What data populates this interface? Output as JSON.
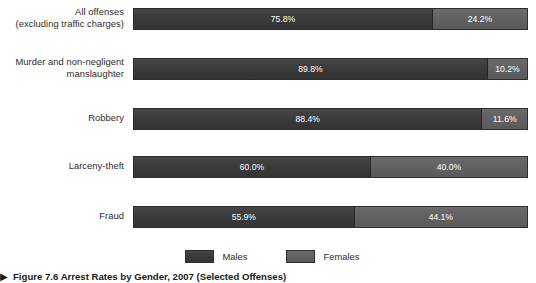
{
  "chart_data": {
    "type": "bar",
    "orientation": "horizontal",
    "stacked": true,
    "stack_total_percent": 100,
    "title": "Figure 7.6 Arrest Rates by Gender, 2007 (Selected Offenses)",
    "xlabel": "",
    "ylabel": "",
    "xlim": [
      0,
      100
    ],
    "grid": false,
    "legend_position": "bottom-center",
    "categories": [
      "All offenses (excluding traffic charges)",
      "Murder and non-negligent manslaughter",
      "Robbery",
      "Larceny-theft",
      "Fraud"
    ],
    "series": [
      {
        "name": "Males",
        "color": "#3d3d3d",
        "values": [
          75.8,
          89.8,
          88.4,
          60.0,
          55.9
        ]
      },
      {
        "name": "Females",
        "color": "#636363",
        "values": [
          24.2,
          10.2,
          11.6,
          40.0,
          44.1
        ]
      }
    ]
  },
  "rows": [
    {
      "label_line1": "All offenses",
      "label_line2": "(excluding traffic charges)",
      "male_value": 75.8,
      "female_value": 24.2,
      "male_label": "75.8%",
      "female_label": "24.2%"
    },
    {
      "label_line1": "Murder and non-negligent",
      "label_line2": "manslaughter",
      "male_value": 89.8,
      "female_value": 10.2,
      "male_label": "89.8%",
      "female_label": "10.2%"
    },
    {
      "label_line1": "Robbery",
      "label_line2": "",
      "male_value": 88.4,
      "female_value": 11.6,
      "male_label": "88.4%",
      "female_label": "11.6%"
    },
    {
      "label_line1": "Larceny-theft",
      "label_line2": "",
      "male_value": 60.0,
      "female_value": 40.0,
      "male_label": "60.0%",
      "female_label": "40.0%"
    },
    {
      "label_line1": "Fraud",
      "label_line2": "",
      "male_value": 55.9,
      "female_value": 44.1,
      "male_label": "55.9%",
      "female_label": "44.1%"
    }
  ],
  "legend": {
    "males_label": "Males",
    "females_label": "Females",
    "males_color": "#3d3d3d",
    "females_color": "#636363"
  },
  "caption": {
    "marker": "▶",
    "text": "Figure 7.6 Arrest Rates by Gender, 2007 (Selected Offenses)"
  }
}
